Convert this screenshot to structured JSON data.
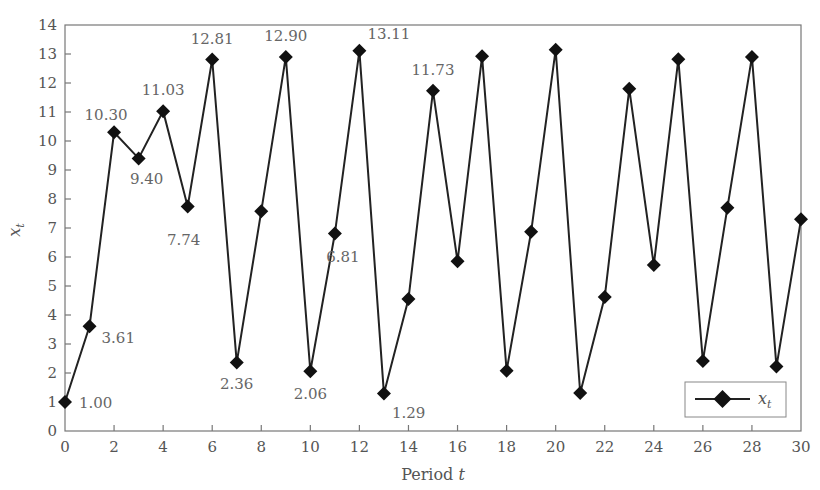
{
  "chart_data": {
    "type": "line",
    "title": "",
    "xlabel": "Period t",
    "ylabel": "x_t",
    "xlim": [
      0,
      30
    ],
    "ylim": [
      0,
      14
    ],
    "xticks": [
      0,
      2,
      4,
      6,
      8,
      10,
      12,
      14,
      16,
      18,
      20,
      22,
      24,
      26,
      28,
      30
    ],
    "yticks": [
      0,
      1,
      2,
      3,
      4,
      5,
      6,
      7,
      8,
      9,
      10,
      11,
      12,
      13,
      14
    ],
    "grid": false,
    "legend_position": "lower right",
    "series": [
      {
        "name": "x_t",
        "marker": "diamond",
        "color": "#222222",
        "x": [
          0,
          1,
          2,
          3,
          4,
          5,
          6,
          7,
          8,
          9,
          10,
          11,
          12,
          13,
          14,
          15,
          16,
          17,
          18,
          19,
          20,
          21,
          22,
          23,
          24,
          25,
          26,
          27,
          28,
          29,
          30
        ],
        "values": [
          1.0,
          3.61,
          10.3,
          9.4,
          11.03,
          7.74,
          12.81,
          2.36,
          7.58,
          12.9,
          2.06,
          6.81,
          13.11,
          1.29,
          4.55,
          11.73,
          5.85,
          12.92,
          2.08,
          6.87,
          13.15,
          1.31,
          4.62,
          11.8,
          5.72,
          12.82,
          2.41,
          7.7,
          12.9,
          2.22,
          7.3
        ]
      }
    ],
    "annotations": [
      {
        "x": 0,
        "text": "1.00"
      },
      {
        "x": 1,
        "text": "3.61"
      },
      {
        "x": 2,
        "text": "10.30"
      },
      {
        "x": 3,
        "text": "9.40"
      },
      {
        "x": 4,
        "text": "11.03"
      },
      {
        "x": 5,
        "text": "7.74"
      },
      {
        "x": 6,
        "text": "12.81"
      },
      {
        "x": 7,
        "text": "2.36"
      },
      {
        "x": 9,
        "text": "12.90"
      },
      {
        "x": 10,
        "text": "2.06"
      },
      {
        "x": 11,
        "text": "6.81"
      },
      {
        "x": 12,
        "text": "13.11"
      },
      {
        "x": 13,
        "text": "1.29"
      },
      {
        "x": 15,
        "text": "11.73"
      }
    ]
  },
  "axes": {
    "xlabel_main": "Period ",
    "xlabel_var": "t",
    "ylabel_main": "x",
    "ylabel_sub": "t"
  },
  "legend": {
    "label_main": "x",
    "label_sub": "t"
  }
}
